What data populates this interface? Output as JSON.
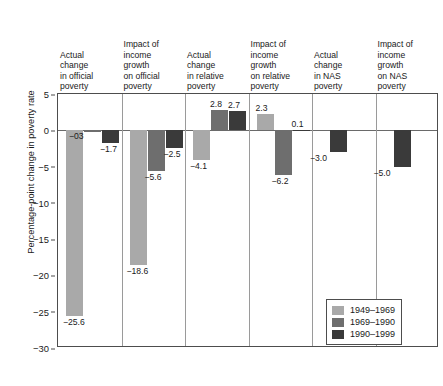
{
  "chart_data": {
    "type": "bar",
    "title": "",
    "subtitle": "",
    "xlabel": "",
    "ylabel": "Percentage-point change in poverty rate",
    "ylim": [
      -30,
      5
    ],
    "yticks": [
      5,
      0,
      -5,
      -10,
      -15,
      -20,
      -25,
      -30
    ],
    "ytick_labels": [
      "5",
      "0",
      "−5",
      "−10",
      "−15",
      "−20",
      "−25",
      "−30"
    ],
    "grid": false,
    "legend_position": "inside-bottom-right",
    "categories": [
      "Actual change in official poverty",
      "Impact of income growth on official poverty",
      "Actual change in relative poverty",
      "Impact of income growth on relative poverty",
      "Actual change in NAS poverty",
      "Impact of income growth on NAS poverty"
    ],
    "category_lines": [
      [
        "Actual",
        "change",
        "in official",
        "poverty"
      ],
      [
        "Impact of",
        "income",
        "growth",
        "on official",
        "poverty"
      ],
      [
        "Actual",
        "change",
        "in relative",
        "poverty"
      ],
      [
        "Impact of",
        "income",
        "growth",
        "on relative",
        "poverty"
      ],
      [
        "Actual",
        "change",
        "in NAS",
        "poverty"
      ],
      [
        "Impact of",
        "income",
        "growth",
        "on NAS",
        "poverty"
      ]
    ],
    "series": [
      {
        "name": "1949–1969",
        "color": "#a9a9a9",
        "values": [
          -25.6,
          -18.6,
          -4.1,
          2.3,
          null,
          null
        ],
        "labels": [
          "−25.6",
          "−18.6",
          "−4.1",
          "2.3",
          "",
          ""
        ]
      },
      {
        "name": "1969–1990",
        "color": "#6e6e6e",
        "values": [
          -0.3,
          -5.6,
          2.8,
          -6.2,
          null,
          null
        ],
        "labels": [
          "−03",
          "−5.6",
          "2.8",
          "−6.2",
          "",
          ""
        ]
      },
      {
        "name": "1990–1999",
        "color": "#3a3a3a",
        "values": [
          -1.7,
          -2.5,
          2.7,
          0.1,
          -3.0,
          -5.0
        ],
        "labels": [
          "−1.7",
          "−2.5",
          "2.7",
          "0.1",
          "−3.0",
          "−5.0"
        ]
      }
    ]
  },
  "legend": {
    "items": [
      {
        "label": "1949–1969",
        "color": "#a9a9a9"
      },
      {
        "label": "1969–1990",
        "color": "#6e6e6e"
      },
      {
        "label": "1990–1999",
        "color": "#3a3a3a"
      }
    ]
  }
}
